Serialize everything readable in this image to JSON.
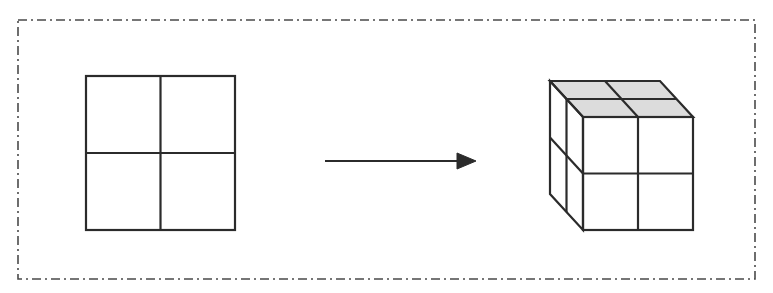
{
  "figure": {
    "title": "Two-dimensional 2x2 grid transformed into a three-dimensional 2x2x2 cube",
    "background_color": "#ffffff",
    "width": 773,
    "height": 293
  },
  "frame": {
    "style": "dash-dot",
    "color": "#4a4a4a",
    "stroke_width": 1.6,
    "dash_pattern": "9 4 2 4",
    "x": 18,
    "y": 20,
    "width": 737,
    "height": 259
  },
  "shapes": {
    "square_grid": {
      "label": "2D square divided into 4 cells",
      "line_color": "#2b2b2b",
      "fill_color": "#ffffff",
      "stroke_width": 2.2,
      "x": 86,
      "y": 76,
      "width": 149,
      "height": 154,
      "rows": 2,
      "cols": 2
    },
    "arrow": {
      "label": "transformation arrow pointing right",
      "color": "#2b2b2b",
      "stroke_width": 2,
      "x1": 325,
      "y1": 161,
      "x2": 476,
      "y2": 161,
      "head_length": 19,
      "head_half_height": 8
    },
    "cube": {
      "label": "3D cube of 2x2x2 unit cubes",
      "line_color": "#2b2b2b",
      "front_fill_color": "#ffffff",
      "top_fill_color": "#dcdcdc",
      "left_fill_color": "#ffffff",
      "stroke_width": 2.2,
      "front_x": 583,
      "front_y": 117,
      "front_width": 110,
      "front_height": 113,
      "depth_dx": -33,
      "depth_dy": -36,
      "rows": 2,
      "cols": 2,
      "layers": 2
    }
  },
  "annotations": {
    "source_label": "2D grid",
    "target_label": "3D cube",
    "relation_label": "becomes"
  }
}
